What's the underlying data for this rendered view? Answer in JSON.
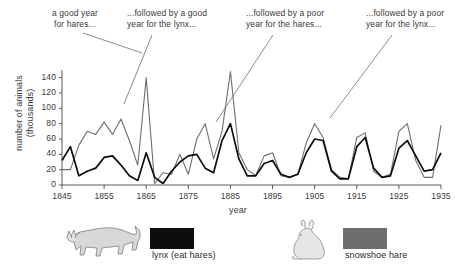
{
  "annotations": [
    {
      "id": "good-year-hares",
      "text": "a good year\nfor hares..."
    },
    {
      "id": "good-year-lynx",
      "text": "...followed by a good\nyear for the lynx..."
    },
    {
      "id": "poor-year-hares",
      "text": "...followed by a poor\nyear for the hares..."
    },
    {
      "id": "poor-year-lynx",
      "text": "...followed by a poor\nyear for the lynx..."
    }
  ],
  "legend": {
    "lynx": {
      "label": "lynx (eat hares)",
      "color": "#0d0d0d",
      "icon": "lynx-icon"
    },
    "hare": {
      "label": "snowshoe hare",
      "color": "#6e6e6e",
      "icon": "hare-icon"
    }
  },
  "chart_data": {
    "type": "line",
    "title": "",
    "xlabel": "year",
    "ylabel": "number of animals\n(thousands)",
    "xlim": [
      1845,
      1935
    ],
    "ylim": [
      0,
      150
    ],
    "xticks": [
      1845,
      1855,
      1865,
      1875,
      1885,
      1895,
      1905,
      1915,
      1925,
      1935
    ],
    "yticks": [
      0,
      20,
      40,
      60,
      80,
      100,
      120,
      140
    ],
    "grid": false,
    "legend_position": "below-plot",
    "x": [
      1845,
      1847,
      1849,
      1851,
      1853,
      1855,
      1857,
      1859,
      1861,
      1863,
      1865,
      1867,
      1869,
      1871,
      1873,
      1875,
      1877,
      1879,
      1881,
      1883,
      1885,
      1887,
      1889,
      1891,
      1893,
      1895,
      1897,
      1899,
      1901,
      1903,
      1905,
      1907,
      1909,
      1911,
      1913,
      1915,
      1917,
      1919,
      1921,
      1923,
      1925,
      1927,
      1929,
      1931,
      1933,
      1935
    ],
    "series": [
      {
        "name": "snowshoe hare",
        "color": "#6e6e6e",
        "values": [
          20,
          20,
          52,
          70,
          66,
          82,
          66,
          86,
          58,
          26,
          140,
          2,
          16,
          14,
          40,
          14,
          60,
          80,
          34,
          70,
          148,
          42,
          20,
          12,
          38,
          42,
          12,
          10,
          14,
          55,
          80,
          62,
          20,
          10,
          8,
          62,
          68,
          18,
          10,
          14,
          70,
          80,
          32,
          10,
          10,
          78
        ]
      },
      {
        "name": "lynx (eat hares)",
        "color": "#0d0d0d",
        "values": [
          32,
          50,
          12,
          18,
          22,
          36,
          38,
          26,
          12,
          6,
          42,
          10,
          2,
          18,
          30,
          38,
          40,
          22,
          16,
          58,
          80,
          34,
          12,
          12,
          28,
          32,
          14,
          10,
          14,
          42,
          60,
          58,
          18,
          8,
          8,
          50,
          62,
          22,
          10,
          12,
          48,
          58,
          38,
          18,
          20,
          42
        ]
      }
    ]
  }
}
